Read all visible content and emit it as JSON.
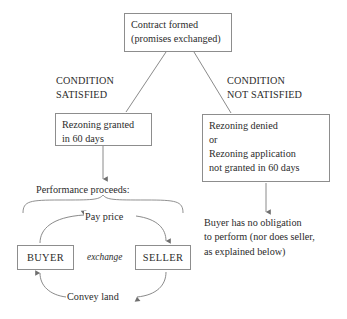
{
  "diagram": {
    "ink_color": "#2b2b2b",
    "border_color": "#8d8d8d",
    "background": "#ffffff"
  },
  "nodes": {
    "contract_formed": "Contract formed\n(promises exchanged)",
    "rezoning_granted": "Rezoning granted\nin 60 days",
    "rezoning_denied": "Rezoning denied\nor\nRezoning application\nnot granted in 60 days",
    "buyer": "BUYER",
    "seller": "SELLER"
  },
  "labels": {
    "condition_satisfied": "CONDITION\nSATISFIED",
    "condition_not_satisfied": "CONDITION\nNOT SATISFIED",
    "performance_proceeds": "Performance proceeds:",
    "no_obligation": "Buyer has no obligation\nto perform (nor does seller,\nas explained below)"
  },
  "edges": {
    "pay_price": "Pay price",
    "convey_land": "Convey land",
    "exchange": "exchange"
  }
}
